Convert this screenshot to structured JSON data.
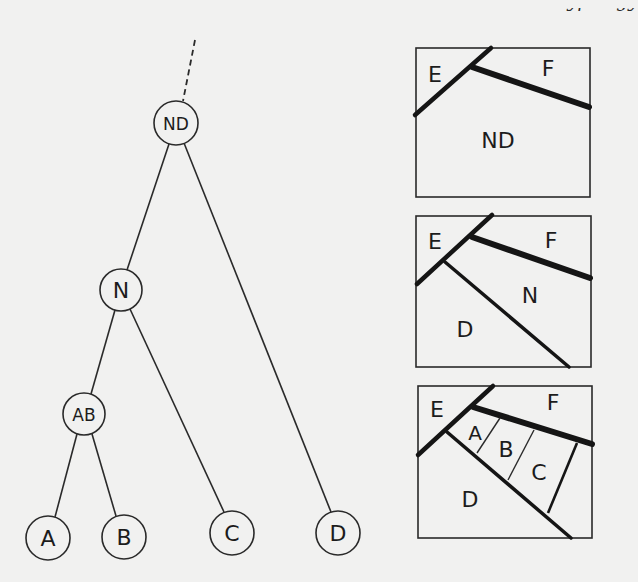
{
  "header": {
    "cut_off_text": "typology"
  },
  "tree": {
    "root_label": "ND",
    "nodes": [
      {
        "id": "ND",
        "label": "ND"
      },
      {
        "id": "N",
        "label": "N"
      },
      {
        "id": "AB",
        "label": "AB"
      },
      {
        "id": "A",
        "label": "A"
      },
      {
        "id": "B",
        "label": "B"
      },
      {
        "id": "C",
        "label": "C"
      },
      {
        "id": "D",
        "label": "D"
      }
    ],
    "edges": [
      {
        "from": "ND",
        "to": "N"
      },
      {
        "from": "ND",
        "to": "D"
      },
      {
        "from": "N",
        "to": "AB"
      },
      {
        "from": "N",
        "to": "C"
      },
      {
        "from": "AB",
        "to": "A"
      },
      {
        "from": "AB",
        "to": "B"
      }
    ],
    "ancestor_branch": "dashed"
  },
  "panels": [
    {
      "name": "stage-1",
      "labels": {
        "E": "E",
        "F": "F",
        "region": "ND"
      }
    },
    {
      "name": "stage-2",
      "labels": {
        "E": "E",
        "F": "F",
        "N": "N",
        "D": "D"
      }
    },
    {
      "name": "stage-3",
      "labels": {
        "E": "E",
        "F": "F",
        "A": "A",
        "B": "B",
        "C": "C",
        "D": "D"
      }
    }
  ]
}
